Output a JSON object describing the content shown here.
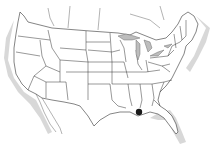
{
  "map": {
    "title": "",
    "region": "United States (contiguous) with state boundaries",
    "highlight": {
      "label": "",
      "location": "southeast Louisiana",
      "color": "#1a1a1a",
      "x": 139,
      "y": 112
    },
    "colors": {
      "land": "#ffffff",
      "border": "#333333",
      "coast_shadow": "#d8d8d8",
      "lakes": "#bdbdbd"
    }
  }
}
